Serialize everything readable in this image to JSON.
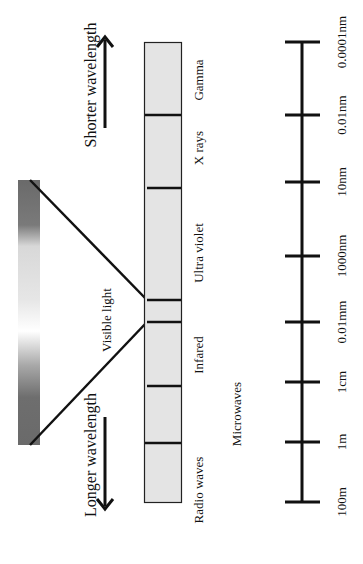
{
  "diagram": {
    "orientation": "rotated 90 degrees counter-clockwise",
    "direction_labels": {
      "shorter": "Shorter wavelength",
      "longer": "Longer wavelength"
    },
    "visible_label": "Visible  light",
    "bands": [
      {
        "name": "Gamma"
      },
      {
        "name": "X rays"
      },
      {
        "name": "Ultra violet"
      },
      {
        "name": "Visible"
      },
      {
        "name": "Infared"
      },
      {
        "name": "Microwaves"
      },
      {
        "name": "Radio waves"
      }
    ],
    "band_labels": {
      "gamma": "Gamma",
      "xrays": "X rays",
      "uv": "Ultra violet",
      "infrared": "Infared",
      "microwaves": "Microwaves",
      "radio": "Radio waves"
    },
    "scale_ticks": [
      "0.0001nm",
      "0.01nm",
      "10nm",
      "1000nm",
      "0.01mm",
      "1cm",
      "1m",
      "100m"
    ],
    "colors": {
      "bar_fill": "#e4e4e4",
      "line": "#111111",
      "gradient_dark": "#6a6a6a",
      "gradient_light": "#ffffff"
    }
  }
}
